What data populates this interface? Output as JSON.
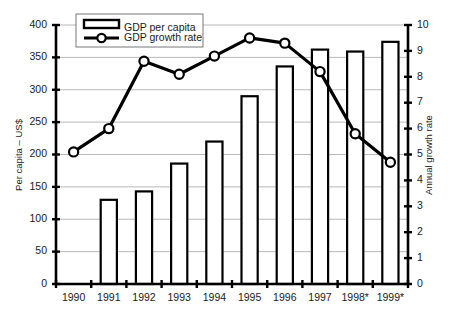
{
  "chart_data": {
    "type": "bar",
    "title": "",
    "subtitle": "",
    "categories": [
      "1990",
      "1991",
      "1992",
      "1993",
      "1994",
      "1995",
      "1996",
      "1997",
      "1998*",
      "1999*"
    ],
    "xlabel": "",
    "ylabel": "Per capita – US$",
    "y2label": "Annual growth rate",
    "ylim": [
      0,
      400
    ],
    "y2lim": [
      0,
      10
    ],
    "yticks": [
      0,
      50,
      100,
      150,
      200,
      250,
      300,
      350,
      400
    ],
    "ytick_labels": [
      "0",
      "50",
      "100",
      "150",
      "200",
      "250",
      "300",
      "350",
      "400"
    ],
    "y2ticks": [
      0,
      1,
      2,
      3,
      4,
      5,
      6,
      7,
      8,
      9,
      10
    ],
    "y2tick_labels": [
      "0",
      "1",
      "2",
      "3",
      "4",
      "5",
      "6",
      "7",
      "8",
      "9",
      "10"
    ],
    "grid": true,
    "legend_position": "top-left",
    "series": [
      {
        "name": "GDP per capita",
        "type": "bar",
        "axis": "left",
        "unit": "US$",
        "values": [
          null,
          130,
          143,
          186,
          220,
          290,
          336,
          362,
          359,
          374
        ]
      },
      {
        "name": "GDP growth rate",
        "type": "line",
        "axis": "right",
        "unit": "percent",
        "marker": "circle",
        "values": [
          5.1,
          6.0,
          8.6,
          8.1,
          8.8,
          9.5,
          9.3,
          8.2,
          5.8,
          4.7
        ]
      }
    ]
  },
  "legend": {
    "items": [
      {
        "label": "GDP per capita",
        "glyph": "bar-swatch"
      },
      {
        "label": "GDP growth rate",
        "glyph": "line-circle-swatch"
      }
    ]
  },
  "axes": {
    "left_title": "Per capita – US$",
    "right_title": "Annual growth rate"
  },
  "colors": {
    "ink": "#000000",
    "grid": "#9a9a9a",
    "background": "#ffffff"
  }
}
